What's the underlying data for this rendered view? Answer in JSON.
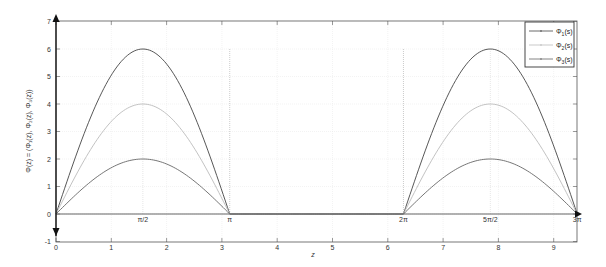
{
  "chart_data": {
    "type": "line",
    "title": "",
    "xlabel": "z",
    "ylabel": "Φ(z) = (Φ₁(z), Φ₂(z), Φ₃(z))",
    "xlim": [
      0,
      9.4248
    ],
    "ylim": [
      -1,
      7
    ],
    "grid": true,
    "legend_position": "upper right",
    "x_ticks": [
      0,
      1,
      2,
      3,
      4,
      5,
      6,
      7,
      8,
      9
    ],
    "y_ticks": [
      -1,
      0,
      1,
      2,
      3,
      4,
      5,
      6,
      7
    ],
    "annotations": [
      {
        "text": "π/2",
        "x": 1.5708,
        "y": 0
      },
      {
        "text": "π",
        "x": 3.1416,
        "y": 0
      },
      {
        "text": "2π",
        "x": 6.2832,
        "y": 0
      },
      {
        "text": "5π/2",
        "x": 7.854,
        "y": 0
      },
      {
        "text": "3π",
        "x": 9.4248,
        "y": 0
      }
    ],
    "reference_lines": [
      {
        "type": "vertical",
        "x": 3.1416,
        "y_from": 0,
        "y_to": 6,
        "style": "dotted"
      },
      {
        "type": "vertical",
        "x": 6.2832,
        "y_from": 0,
        "y_to": 6,
        "style": "dotted"
      }
    ],
    "series": [
      {
        "name": "Φ₁(s)",
        "color": "#444444",
        "amplitude": 6,
        "x": [
          0,
          0.785,
          1.571,
          2.356,
          3.142,
          4.712,
          6.283,
          7.069,
          7.854,
          8.639,
          9.425
        ],
        "values": [
          0,
          4.24,
          6,
          4.24,
          0,
          0,
          0,
          4.24,
          6,
          4.24,
          0
        ]
      },
      {
        "name": "Φ₂(s)",
        "color": "#bbbbbb",
        "amplitude": 4,
        "x": [
          0,
          0.785,
          1.571,
          2.356,
          3.142,
          4.712,
          6.283,
          7.069,
          7.854,
          8.639,
          9.425
        ],
        "values": [
          0,
          2.83,
          4,
          2.83,
          0,
          0,
          0,
          2.83,
          4,
          2.83,
          0
        ]
      },
      {
        "name": "Φ₃(s)",
        "color": "#666666",
        "amplitude": 2,
        "x": [
          0,
          0.785,
          1.571,
          2.356,
          3.142,
          4.712,
          6.283,
          7.069,
          7.854,
          8.639,
          9.425
        ],
        "values": [
          0,
          1.41,
          2,
          1.41,
          0,
          0,
          0,
          1.41,
          2,
          1.41,
          0
        ]
      }
    ]
  },
  "legend": {
    "items": [
      {
        "label_base": "Φ",
        "sub": "1",
        "arg": "(s)"
      },
      {
        "label_base": "Φ",
        "sub": "2",
        "arg": "(s)"
      },
      {
        "label_base": "Φ",
        "sub": "3",
        "arg": "(s)"
      }
    ]
  },
  "axes": {
    "xlabel": "z",
    "ylabel": "Φ(z) = (Φ₁(z), Φ₂(z), Φ₃(z))"
  }
}
